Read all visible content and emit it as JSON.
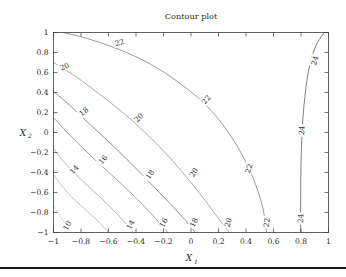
{
  "figure": {
    "title": "Contour plot",
    "background_color": "#ffffff",
    "frame_color": "#3a3a3a",
    "rule_color": "#1a1a1a"
  },
  "axes": {
    "x_title": "X",
    "x_subscript": "1",
    "y_title": "X",
    "y_subscript": "2",
    "x_ticks": [
      "−1",
      "−0.8",
      "−0.6",
      "−0.4",
      "−0.2",
      "0",
      "0.2",
      "0.4",
      "0.6",
      "0.8",
      "1"
    ],
    "y_ticks": [
      "1",
      "0.8",
      "0.6",
      "0.4",
      "0.2",
      "0",
      "−0.2",
      "−0.4",
      "−0.6",
      "−0.8",
      "−1"
    ]
  },
  "chart_data": {
    "type": "contour",
    "title": "Contour plot",
    "xlabel": "X1",
    "ylabel": "X2",
    "xlim": [
      -1,
      1
    ],
    "ylim": [
      -1,
      1
    ],
    "grid": false,
    "legend": "none",
    "tick_values_x": [
      -1,
      -0.8,
      -0.6,
      -0.4,
      -0.2,
      0,
      0.2,
      0.4,
      0.6,
      0.8,
      1
    ],
    "tick_values_y": [
      -1,
      -0.8,
      -0.6,
      -0.4,
      -0.2,
      0,
      0.2,
      0.4,
      0.6,
      0.8,
      1
    ],
    "levels": [
      10,
      12,
      14,
      16,
      18,
      20,
      22,
      24
    ],
    "labeled_levels": [
      10,
      14,
      16,
      18,
      20,
      22,
      24
    ],
    "level_colors": [
      "#c8c8c8",
      "#b2b2b2",
      "#9a9a9a",
      "#848484",
      "#6c6c6c",
      "#8e8e8e",
      "#7a7a7a",
      "#565656"
    ],
    "contours": [
      {
        "level": 10,
        "color": "#c8c8c8",
        "points": [
          [
            -1,
            -0.73
          ],
          [
            -0.97,
            -0.8
          ],
          [
            -0.94,
            -0.86
          ],
          [
            -0.91,
            -0.93
          ],
          [
            -0.89,
            -1
          ]
        ],
        "labels": [
          {
            "text": "10",
            "x": -0.9,
            "y": -0.93,
            "rotation": -62
          }
        ]
      },
      {
        "level": 12,
        "color": "#b2b2b2",
        "points": [
          [
            -1,
            -0.42
          ],
          [
            -0.93,
            -0.55
          ],
          [
            -0.85,
            -0.67
          ],
          [
            -0.76,
            -0.78
          ],
          [
            -0.68,
            -0.88
          ],
          [
            -0.6,
            -1
          ]
        ],
        "labels": []
      },
      {
        "level": 14,
        "color": "#9a9a9a",
        "points": [
          [
            -1,
            -0.16
          ],
          [
            -0.92,
            -0.3
          ],
          [
            -0.83,
            -0.43
          ],
          [
            -0.73,
            -0.56
          ],
          [
            -0.62,
            -0.7
          ],
          [
            -0.52,
            -0.84
          ],
          [
            -0.42,
            -1
          ]
        ],
        "labels": [
          {
            "text": "14",
            "x": -0.85,
            "y": -0.37,
            "rotation": -48
          },
          {
            "text": "14",
            "x": -0.44,
            "y": -0.92,
            "rotation": -63
          }
        ]
      },
      {
        "level": 16,
        "color": "#848484",
        "points": [
          [
            -1,
            0.15
          ],
          [
            -0.9,
            0.0
          ],
          [
            -0.79,
            -0.15
          ],
          [
            -0.67,
            -0.31
          ],
          [
            -0.54,
            -0.47
          ],
          [
            -0.41,
            -0.64
          ],
          [
            -0.29,
            -0.81
          ],
          [
            -0.17,
            -1
          ]
        ],
        "labels": [
          {
            "text": "16",
            "x": -0.64,
            "y": -0.27,
            "rotation": -50
          },
          {
            "text": "16",
            "x": -0.2,
            "y": -0.9,
            "rotation": -62
          }
        ]
      },
      {
        "level": 18,
        "color": "#6c6c6c",
        "points": [
          [
            -1,
            0.41
          ],
          [
            -0.88,
            0.27
          ],
          [
            -0.75,
            0.1
          ],
          [
            -0.6,
            -0.09
          ],
          [
            -0.45,
            -0.29
          ],
          [
            -0.3,
            -0.5
          ],
          [
            -0.16,
            -0.7
          ],
          [
            -0.04,
            -0.88
          ],
          [
            0.03,
            -1
          ]
        ],
        "labels": [
          {
            "text": "18",
            "x": -0.78,
            "y": 0.21,
            "rotation": -40
          },
          {
            "text": "18",
            "x": -0.3,
            "y": -0.42,
            "rotation": -55
          },
          {
            "text": "18",
            "x": 0.02,
            "y": -0.9,
            "rotation": -66
          }
        ]
      },
      {
        "level": 20,
        "color": "#8e8e8e",
        "points": [
          [
            -1,
            0.7
          ],
          [
            -0.86,
            0.58
          ],
          [
            -0.71,
            0.43
          ],
          [
            -0.55,
            0.26
          ],
          [
            -0.38,
            0.06
          ],
          [
            -0.21,
            -0.17
          ],
          [
            -0.06,
            -0.4
          ],
          [
            0.08,
            -0.64
          ],
          [
            0.2,
            -0.86
          ],
          [
            0.28,
            -1
          ]
        ],
        "labels": [
          {
            "text": "20",
            "x": -0.92,
            "y": 0.66,
            "rotation": -23
          },
          {
            "text": "20",
            "x": -0.38,
            "y": 0.15,
            "rotation": -44
          },
          {
            "text": "20",
            "x": 0.02,
            "y": -0.4,
            "rotation": -58
          },
          {
            "text": "20",
            "x": 0.27,
            "y": -0.9,
            "rotation": -72
          }
        ]
      },
      {
        "level": 22,
        "color": "#7a7a7a",
        "points": [
          [
            -0.93,
            1
          ],
          [
            -0.78,
            0.95
          ],
          [
            -0.6,
            0.87
          ],
          [
            -0.42,
            0.77
          ],
          [
            -0.24,
            0.64
          ],
          [
            -0.07,
            0.48
          ],
          [
            0.09,
            0.3
          ],
          [
            0.23,
            0.08
          ],
          [
            0.35,
            -0.17
          ],
          [
            0.45,
            -0.45
          ],
          [
            0.52,
            -0.74
          ],
          [
            0.55,
            -1
          ]
        ],
        "labels": [
          {
            "text": "22",
            "x": -0.52,
            "y": 0.9,
            "rotation": -17
          },
          {
            "text": "22",
            "x": 0.11,
            "y": 0.33,
            "rotation": -50
          },
          {
            "text": "22",
            "x": 0.42,
            "y": -0.36,
            "rotation": -72
          },
          {
            "text": "22",
            "x": 0.55,
            "y": -0.9,
            "rotation": -84
          }
        ]
      },
      {
        "level": 24,
        "color": "#565656",
        "points": [
          [
            0.97,
            1
          ],
          [
            0.92,
            0.9
          ],
          [
            0.88,
            0.76
          ],
          [
            0.85,
            0.58
          ],
          [
            0.83,
            0.38
          ],
          [
            0.815,
            0.16
          ],
          [
            0.805,
            -0.08
          ],
          [
            0.8,
            -0.32
          ],
          [
            0.798,
            -0.57
          ],
          [
            0.797,
            -0.8
          ],
          [
            0.797,
            -1
          ]
        ],
        "labels": [
          {
            "text": "24",
            "x": 0.9,
            "y": 0.72,
            "rotation": -72
          },
          {
            "text": "24",
            "x": 0.805,
            "y": 0.02,
            "rotation": -86
          },
          {
            "text": "24",
            "x": 0.797,
            "y": -0.86,
            "rotation": -88
          }
        ]
      }
    ]
  }
}
